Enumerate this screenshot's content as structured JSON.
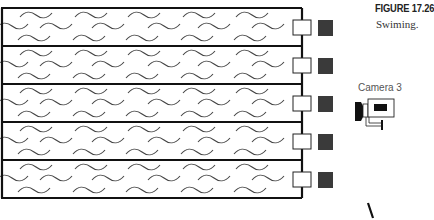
{
  "figure": {
    "title": "FIGURE 17.26",
    "caption": "Swiming."
  },
  "pool": {
    "lane_count": 5,
    "lanes": [
      {
        "index": 1,
        "label": "lane-1"
      },
      {
        "index": 2,
        "label": "lane-2"
      },
      {
        "index": 3,
        "label": "lane-3"
      },
      {
        "index": 4,
        "label": "lane-4"
      },
      {
        "index": 5,
        "label": "lane-5"
      }
    ],
    "colors": {
      "border": "#111111",
      "water_wave": "#444444",
      "starting_block": "#3a3a3a"
    }
  },
  "camera": {
    "label": "Camera 3",
    "icon": "video-camera-icon"
  }
}
